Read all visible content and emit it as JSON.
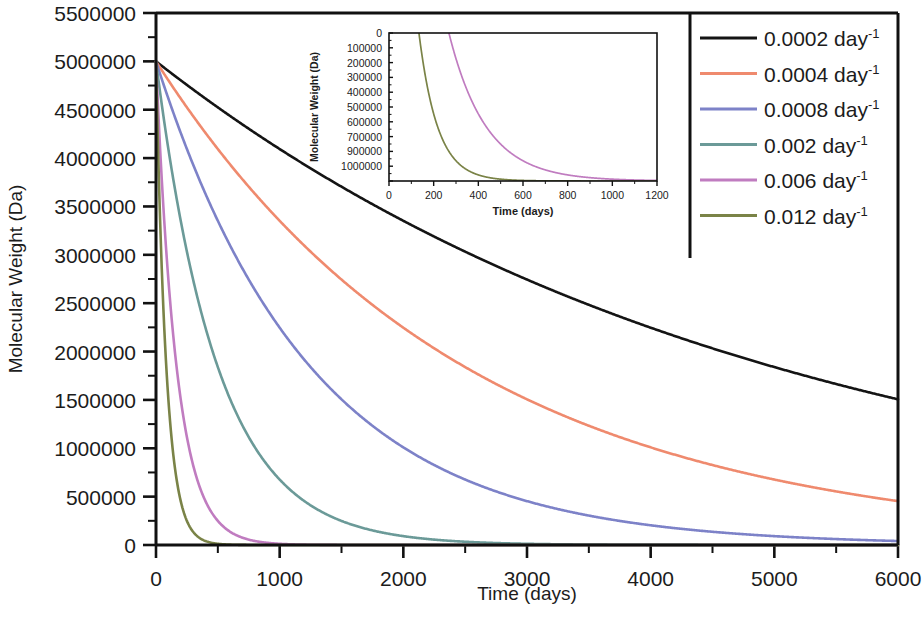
{
  "chart_data": {
    "type": "line",
    "title": "",
    "xlabel": "Time (days)",
    "ylabel": "Molecular Weight (Da)",
    "xlim": [
      0,
      6000
    ],
    "ylim": [
      0,
      5500000
    ],
    "x_ticks": [
      0,
      1000,
      2000,
      3000,
      4000,
      5000,
      6000
    ],
    "x_tick_labels": [
      "0",
      "1000",
      "2000",
      "3000",
      "4000",
      "5000",
      "6000"
    ],
    "x_minor_interval": 500,
    "y_ticks": [
      0,
      500000,
      1000000,
      1500000,
      2000000,
      2500000,
      3000000,
      3500000,
      4000000,
      4500000,
      5000000,
      5500000
    ],
    "y_tick_labels": [
      "0",
      "500000",
      "1000000",
      "1500000",
      "2000000",
      "2500000",
      "3000000",
      "3500000",
      "4000000",
      "4500000",
      "5000000",
      "5500000"
    ],
    "y_minor_interval": 250000,
    "grid": false,
    "legend_position": "top-right",
    "initial_molecular_weight": 5000000,
    "model": "exponential-decay",
    "series": [
      {
        "name": "0.0002 day⁻¹",
        "rate": 0.0002,
        "color": "#141414",
        "x": [
          0,
          500,
          1000,
          1500,
          2000,
          2500,
          3000,
          3500,
          4000,
          4500,
          5000,
          5500,
          6000
        ],
        "values": [
          5000000,
          4524187,
          4093654,
          3704091,
          3351600,
          3032653,
          2744058,
          2482927,
          2246645,
          2032848,
          1839397,
          1664355,
          1505971
        ]
      },
      {
        "name": "0.0004 day⁻¹",
        "rate": 0.0004,
        "color": "#ef8a6e",
        "x": [
          0,
          500,
          1000,
          1500,
          2000,
          2500,
          3000,
          3500,
          4000,
          4500,
          5000,
          5500,
          6000
        ],
        "values": [
          5000000,
          4093654,
          3351600,
          2744058,
          2246645,
          1839397,
          1505971,
          1232923,
          1009434,
          826465,
          676676,
          553954,
          453999
        ]
      },
      {
        "name": "0.0008 day⁻¹",
        "rate": 0.0008,
        "color": "#7d82c8",
        "x": [
          0,
          500,
          1000,
          1500,
          2000,
          2500,
          3000,
          3500,
          4000,
          4500,
          5000,
          5500,
          6000
        ],
        "values": [
          5000000,
          3351600,
          2246645,
          1505971,
          1009434,
          676676,
          453999,
          304404,
          204093,
          136824,
          91727,
          61491,
          41223
        ]
      },
      {
        "name": "0.002 day⁻¹",
        "rate": 0.002,
        "color": "#6b9a98",
        "x": [
          0,
          250,
          500,
          750,
          1000,
          1250,
          1500,
          2000,
          2500,
          3000,
          4000,
          5000,
          6000
        ],
        "values": [
          5000000,
          3032653,
          1839397,
          1115651,
          676676,
          410425,
          248935,
          91578,
          33690,
          12393,
          1677,
          227,
          31
        ]
      },
      {
        "name": "0.006 day⁻¹",
        "rate": 0.006,
        "color": "#c07cc0",
        "x": [
          0,
          100,
          200,
          300,
          400,
          500,
          600,
          700,
          800,
          1000,
          1200,
          1500,
          2000
        ],
        "values": [
          5000000,
          2744058,
          1505971,
          826465,
          453999,
          249152,
          136742,
          75048,
          41188,
          12405,
          3736,
          617,
          30
        ]
      },
      {
        "name": "0.012 day⁻¹",
        "rate": 0.012,
        "color": "#7a8347",
        "x": [
          0,
          50,
          100,
          150,
          200,
          250,
          300,
          350,
          400,
          500,
          600,
          800,
          1000
        ],
        "values": [
          5000000,
          2744058,
          1505971,
          826465,
          453999,
          249152,
          136742,
          75048,
          41188,
          12405,
          3736,
          339,
          31
        ]
      }
    ],
    "inset": {
      "xlabel": "Time (days)",
      "ylabel": "Molecular Weight (Da)",
      "xlim": [
        0,
        1200
      ],
      "ylim": [
        0,
        1000000
      ],
      "x_ticks": [
        0,
        200,
        400,
        600,
        800,
        1000,
        1200
      ],
      "x_tick_labels": [
        "0",
        "200",
        "400",
        "600",
        "800",
        "1000",
        "1200"
      ],
      "y_ticks": [
        0,
        100000,
        200000,
        300000,
        400000,
        500000,
        600000,
        700000,
        900000,
        1000000
      ],
      "y_tick_labels": [
        "0",
        "100000",
        "200000",
        "300000",
        "400000",
        "500000",
        "600000",
        "700000",
        "900000",
        "1000000"
      ],
      "series": [
        {
          "name": "0.006 day⁻¹",
          "rate": 0.006,
          "color": "#c07cc0",
          "x": [
            270,
            300,
            350,
            400,
            450,
            500,
            550,
            600,
            700,
            800,
            900,
            1000,
            1100,
            1200
          ],
          "values": [
            991101,
            826465,
            612626,
            453999,
            336495,
            249152,
            184647,
            136742,
            75048,
            41188,
            22603,
            12405,
            6809,
            3736
          ]
        },
        {
          "name": "0.012 day⁻¹",
          "rate": 0.012,
          "color": "#7a8347",
          "x": [
            134,
            150,
            200,
            250,
            300,
            350,
            400,
            450,
            500,
            600,
            700,
            800,
            1000,
            1200
          ],
          "values": [
            999000,
            826465,
            453999,
            249152,
            136742,
            75048,
            41188,
            22603,
            12405,
            3736,
            1125,
            339,
            31,
            3
          ]
        }
      ]
    }
  },
  "legend": {
    "items": [
      {
        "label": "0.0002 day",
        "exponent": "-1",
        "color": "#141414"
      },
      {
        "label": "0.0004 day",
        "exponent": "-1",
        "color": "#ef8a6e"
      },
      {
        "label": "0.0008 day",
        "exponent": "-1",
        "color": "#7d82c8"
      },
      {
        "label": "0.002 day",
        "exponent": "-1",
        "color": "#6b9a98"
      },
      {
        "label": "0.006 day",
        "exponent": "-1",
        "color": "#c07cc0"
      },
      {
        "label": "0.012 day",
        "exponent": "-1",
        "color": "#7a8347"
      }
    ]
  }
}
